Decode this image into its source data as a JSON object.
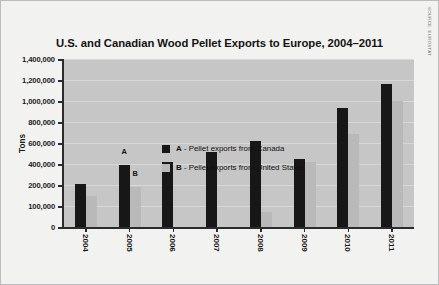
{
  "source": {
    "label": "SOURCE: EUROSTAT"
  },
  "chart_data": {
    "type": "bar",
    "title": "U.S. and Canadian Wood Pellet Exports to Europe, 2004–2011",
    "xlabel": "",
    "ylabel": "Tons",
    "grid": true,
    "legend_position": "inside-top-left",
    "categories": [
      "2004",
      "2005",
      "2006",
      "2007",
      "2008",
      "2009",
      "2010",
      "2011"
    ],
    "ytick_labels": [
      "1,400,000",
      "1,200,000",
      "1,000,000",
      "800,000",
      "600,000",
      "400,000",
      "200,000",
      "100,000",
      "0"
    ],
    "ytick_values": [
      1400000,
      1200000,
      1000000,
      800000,
      600000,
      400000,
      200000,
      100000,
      0
    ],
    "ylim": [
      0,
      1400000
    ],
    "series": [
      {
        "name": "A - Pellet exports from Canada",
        "key": "A",
        "color": "#171717",
        "values": [
          210000,
          390000,
          420000,
          510000,
          620000,
          450000,
          930000,
          1160000
        ]
      },
      {
        "name": "B - Pellet exports from United States",
        "key": "B",
        "color": "#b9b9b9",
        "values": [
          150000,
          190000,
          0,
          0,
          70000,
          420000,
          690000,
          1000000
        ]
      }
    ],
    "annotations": [
      {
        "text": "A",
        "category": "2005",
        "series": "A"
      },
      {
        "text": "B",
        "category": "2005",
        "series": "B"
      }
    ],
    "legend": [
      {
        "marker": "A",
        "color": "#171717",
        "label": "- Pellet exports from Canada"
      },
      {
        "marker": "B",
        "color": "#b9b9b9",
        "label": "- Pellet exports from United States"
      }
    ]
  }
}
